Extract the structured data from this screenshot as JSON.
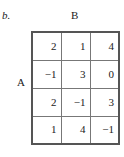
{
  "part_label": "b.",
  "column_player_label": "B",
  "row_player_label": "A",
  "matrix": [
    [
      "2",
      "1",
      "4"
    ],
    [
      "−1",
      "3",
      "0"
    ],
    [
      "2",
      "−1",
      "3"
    ],
    [
      "1",
      "4",
      "−1"
    ]
  ]
}
